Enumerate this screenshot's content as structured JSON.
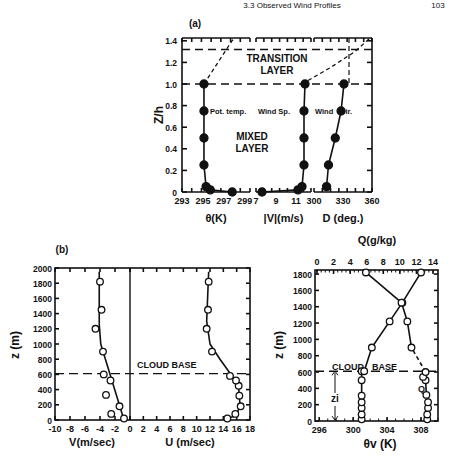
{
  "page_header": {
    "running_title": "3.3 Observed Wind Profiles",
    "page_number": "103"
  },
  "panel_a": {
    "label": "(a)",
    "ylabel": "Z/h",
    "yticks": [
      "0",
      "0.2",
      "0.4",
      "0.6",
      "0.8",
      "1.0",
      "1.2",
      "1.4"
    ],
    "transition_text_1": "TRANSITION",
    "transition_text_2": "LAYER",
    "mixed_text_1": "MIXED",
    "mixed_text_2": "LAYER",
    "theta": {
      "label": "Pot. temp.",
      "xlabel": "θ(K)",
      "xticks": [
        "293",
        "295",
        "297",
        "299"
      ]
    },
    "speed": {
      "label": "Wind Sp.",
      "xlabel": "|V|(m/s)",
      "xticks": [
        "7",
        "9",
        "11"
      ]
    },
    "dir": {
      "label_1": "Wind",
      "label_2": "Dir.",
      "xlabel": "D (deg.)",
      "xticks": [
        "300",
        "330",
        "360"
      ]
    }
  },
  "panel_b": {
    "label": "(b)",
    "ylabel": "z (m)",
    "yticks": [
      "0",
      "200",
      "400",
      "600",
      "800",
      "1000",
      "1200",
      "1400",
      "1600",
      "1800",
      "2000"
    ],
    "v_xlabel": "V(m/sec)",
    "v_xticks": [
      "-10",
      "-8",
      "-6",
      "-4",
      "-2",
      "0"
    ],
    "u_xlabel": "U (m/sec)",
    "u_xticks": [
      "0",
      "2",
      "4",
      "6",
      "8",
      "10",
      "12",
      "14",
      "16",
      "18"
    ],
    "cloud_base": "CLOUD BASE"
  },
  "panel_c": {
    "ylabel": "z (m)",
    "yticks": [
      "0",
      "200",
      "400",
      "600",
      "800",
      "1000",
      "1200",
      "1400",
      "1600",
      "1800"
    ],
    "top_xlabel": "Q(g/kg)",
    "top_xticks": [
      "0",
      "2",
      "4",
      "6",
      "8",
      "10",
      "12",
      "14"
    ],
    "bottom_xlabel": "θv (K)",
    "bottom_xticks": [
      "296",
      "300",
      "304",
      "308"
    ],
    "cloud_text": "CLOUD",
    "base_text": "BASE",
    "q_label": "Q",
    "zi_label": "zi"
  },
  "chart_data": [
    {
      "type": "line",
      "title": "(a) Normalized mixed-layer profiles",
      "ylabel": "Z/h",
      "ylim": [
        0,
        1.5
      ],
      "annotations": [
        "TRANSITION LAYER",
        "MIXED LAYER"
      ],
      "reference_lines": [
        {
          "y": 1.0,
          "style": "dashed"
        },
        {
          "y": 1.32,
          "style": "dashed"
        }
      ],
      "series": [
        {
          "name": "Pot. temp.",
          "xlabel": "θ(K)",
          "xlim": [
            293,
            299.5
          ],
          "x": [
            297.8,
            295.7,
            295.3,
            295.1,
            295.1,
            295.1,
            295.1
          ],
          "y": [
            0.0,
            0.02,
            0.05,
            0.25,
            0.5,
            0.75,
            1.0
          ]
        },
        {
          "name": "Wind Sp.",
          "xlabel": "|V|(m/s)",
          "xlim": [
            7,
            12.5
          ],
          "x": [
            7.6,
            11.2,
            11.6,
            11.8,
            11.8,
            11.8,
            11.9
          ],
          "y": [
            0.0,
            0.02,
            0.05,
            0.25,
            0.5,
            0.75,
            1.0
          ]
        },
        {
          "name": "Wind Dir.",
          "xlabel": "D (deg.)",
          "xlim": [
            300,
            360
          ],
          "x": [
            313,
            315,
            322,
            328,
            331
          ],
          "y": [
            0.05,
            0.25,
            0.5,
            0.75,
            1.0
          ]
        }
      ]
    },
    {
      "type": "scatter",
      "title": "(b) V and U wind components",
      "ylabel": "z (m)",
      "ylim": [
        0,
        2000
      ],
      "reference_lines": [
        {
          "y": 610,
          "label": "CLOUD BASE",
          "style": "dashed"
        }
      ],
      "series": [
        {
          "name": "V",
          "xlabel": "V(m/sec)",
          "xlim": [
            -10,
            0
          ],
          "x": [
            -0.8,
            -2.5,
            -1.4,
            -3.2,
            -2.6,
            -3.5,
            -3.6,
            -4.6,
            -3.8,
            -4.0
          ],
          "y": [
            20,
            80,
            180,
            330,
            520,
            600,
            900,
            1200,
            1450,
            1820
          ]
        },
        {
          "name": "U",
          "xlabel": "U (m/sec)",
          "xlim": [
            0,
            18
          ],
          "x": [
            14.6,
            15.8,
            16.6,
            16.4,
            16.3,
            15.9,
            15.0,
            12.3,
            11.5,
            11.7,
            11.8
          ],
          "y": [
            20,
            80,
            180,
            320,
            450,
            520,
            580,
            900,
            1200,
            1450,
            1820
          ]
        }
      ]
    },
    {
      "type": "line",
      "title": "θv and Q profiles",
      "ylabel": "z (m)",
      "ylim": [
        0,
        1850
      ],
      "reference_lines": [
        {
          "y": 610,
          "label": "CLOUD BASE",
          "style": "dashed"
        }
      ],
      "series": [
        {
          "name": "θv",
          "xlabel": "θv (K)",
          "xlim": [
            295.5,
            310
          ],
          "x": [
            301.0,
            301.0,
            301.0,
            301.0,
            301.0,
            301.0,
            301.0,
            301.3,
            302.2,
            304.3,
            305.8,
            308.0
          ],
          "y": [
            20,
            80,
            160,
            230,
            310,
            500,
            610,
            610,
            900,
            1220,
            1450,
            1820
          ]
        },
        {
          "name": "Q",
          "xlabel": "Q(g/kg)",
          "xlim": [
            0,
            14.5
          ],
          "x": [
            13.3,
            13.3,
            13.4,
            13.4,
            13.2,
            13.1,
            12.8,
            13.1,
            11.4,
            10.9,
            10.2,
            5.9
          ],
          "y": [
            20,
            80,
            160,
            230,
            320,
            500,
            540,
            600,
            900,
            1220,
            1450,
            1820
          ]
        }
      ]
    }
  ]
}
